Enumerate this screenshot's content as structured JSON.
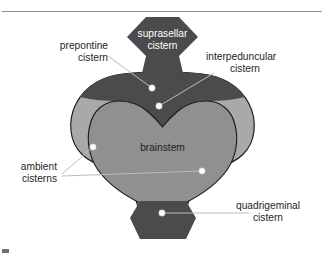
{
  "figure": {
    "background_color": "#ffffff"
  },
  "colors": {
    "outer_cistern": "#a7a9ab",
    "dark_cistern": "#4b4b4d",
    "brainstem": "#8e9092",
    "outline": "#1a1a1a",
    "leader_line": "#b9bcbe",
    "dot_fill": "#ffffff",
    "text_dark": "#231f20",
    "text_light": "#ffffff",
    "rule": "#8d9093"
  },
  "regions": {
    "suprasellar": {
      "name": "suprasellar cistern",
      "label_line1": "suprasellar",
      "label_line2": "cistern",
      "fill": "#4b4b4d",
      "label_color": "#ffffff"
    },
    "prepontine": {
      "name": "prepontine cistern",
      "label_line1": "prepontine",
      "label_line2": "cistern",
      "fill": "#4b4b4d",
      "label_color": "#231f20"
    },
    "interpeduncular": {
      "name": "interpeduncular cistern",
      "label_line1": "interpeduncular",
      "label_line2": "cistern",
      "fill": "#4b4b4d",
      "label_color": "#231f20"
    },
    "ambient": {
      "name": "ambient cisterns",
      "label_line1": "ambient",
      "label_line2": "cisterns",
      "fill": "#a7a9ab",
      "label_color": "#231f20"
    },
    "quadrigeminal": {
      "name": "quadrigeminal cistern",
      "label_line1": "quadrigeminal",
      "label_line2": "cistern",
      "fill": "#4b4b4d",
      "label_color": "#231f20"
    },
    "brainstem": {
      "name": "brainstem",
      "label": "brainstem",
      "fill": "#8e9092",
      "label_color": "#231f20"
    }
  },
  "callout_dots": [
    {
      "name": "prepontine-dot",
      "x": 152,
      "y": 88
    },
    {
      "name": "interpeduncular-dot",
      "x": 159,
      "y": 106
    },
    {
      "name": "ambient-left-dot",
      "x": 93,
      "y": 147
    },
    {
      "name": "ambient-right-dot",
      "x": 202,
      "y": 171
    },
    {
      "name": "quadrigeminal-dot",
      "x": 162,
      "y": 213
    }
  ]
}
